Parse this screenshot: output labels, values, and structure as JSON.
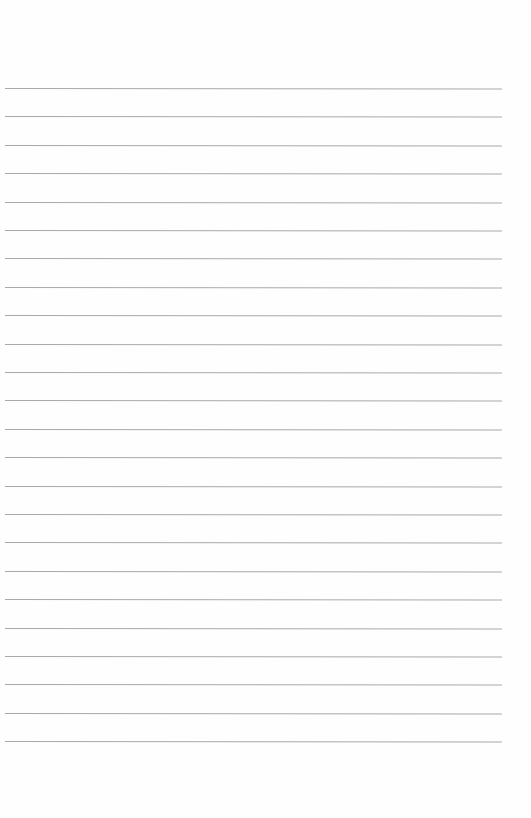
{
  "page": {
    "type": "lined-paper",
    "line_count": 24,
    "first_line_y": 88,
    "line_spacing": 28.4,
    "line_left": 5,
    "line_width": 497,
    "line_color": "#a9a9a9",
    "background": "#fefefe"
  }
}
